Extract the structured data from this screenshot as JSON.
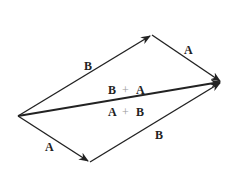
{
  "diagram": {
    "vertices": {
      "origin": [
        18,
        116
      ],
      "top": [
        152,
        35
      ],
      "tip": [
        222,
        82
      ],
      "bottom": [
        90,
        162
      ]
    },
    "vectors": [
      {
        "name": "B",
        "from": "origin",
        "to": "top",
        "label": "B"
      },
      {
        "name": "A",
        "from": "top",
        "to": "tip",
        "label": "A"
      },
      {
        "name": "A",
        "from": "origin",
        "to": "bottom",
        "label": "A"
      },
      {
        "name": "B",
        "from": "bottom",
        "to": "tip",
        "label": "B"
      },
      {
        "name": "resultant",
        "from": "origin",
        "to": "tip"
      }
    ],
    "labels": {
      "top_left_B": "B",
      "top_right_A": "A",
      "bottom_left_A": "A",
      "bottom_right_B": "B",
      "sum_upper_left": "B",
      "sum_upper_op": "+",
      "sum_upper_right": "A",
      "sum_lower_left": "A",
      "sum_lower_op": "+",
      "sum_lower_right": "B"
    },
    "line_color": "#222222"
  }
}
